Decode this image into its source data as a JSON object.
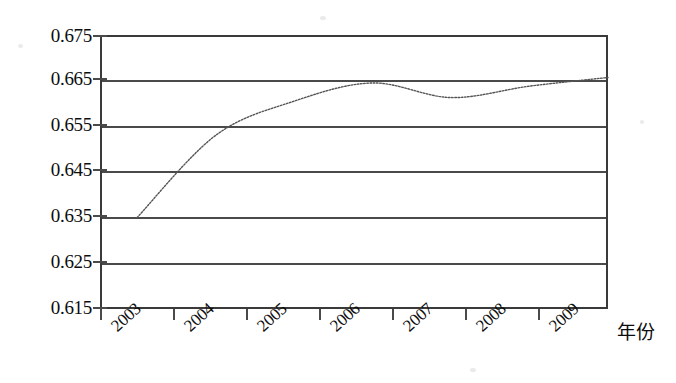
{
  "chart_data": {
    "type": "line",
    "title": "",
    "subtitle": "",
    "xlabel": "年份",
    "ylabel": "",
    "categories": [
      "2003",
      "2004",
      "2005",
      "2006",
      "2007",
      "2008",
      "2009"
    ],
    "x": [
      2003,
      2004,
      2005,
      2006,
      2007,
      2008,
      2009
    ],
    "series": [
      {
        "name": "",
        "values": [
          0.635,
          0.653,
          0.6605,
          0.6645,
          0.6613,
          0.6638,
          0.6657
        ],
        "line_style": "dotted",
        "line_color": "#555555",
        "marker": "none"
      }
    ],
    "ylim": [
      0.615,
      0.675
    ],
    "xlim": [
      2003,
      2009
    ],
    "y_ticks": [
      "0.675",
      "0.665",
      "0.655",
      "0.645",
      "0.635",
      "0.625",
      "0.615"
    ],
    "y_tick_values": [
      0.675,
      0.665,
      0.655,
      0.645,
      0.635,
      0.625,
      0.615
    ],
    "y_tick_step": 0.01,
    "grid": true,
    "grid_axis": "y",
    "legend": false,
    "legend_position": "none",
    "x_tick_label_rotation": -42,
    "frame": true,
    "annotations": []
  },
  "axes": {
    "x_axis_title": "年份",
    "y_axis_title": ""
  },
  "style": {
    "background": "#ffffff",
    "axis_color": "#4a4a4a",
    "text_color": "#0d0d0d",
    "series_color": "#555555"
  }
}
